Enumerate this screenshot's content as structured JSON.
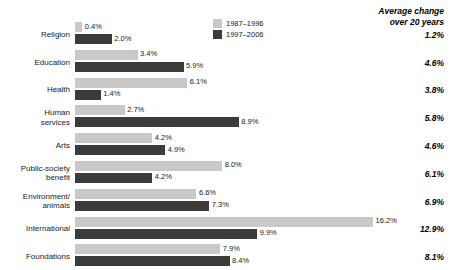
{
  "legend": {
    "position": "top-center-right",
    "items": [
      {
        "label": "1987–1996",
        "color": "#c9c9c9"
      },
      {
        "label": "1997–2006",
        "color": "#3b3b3b"
      }
    ]
  },
  "avg_header": {
    "line1": "Average change",
    "line2": "over 20 years"
  },
  "chart_data": {
    "type": "bar",
    "orientation": "horizontal",
    "title": "",
    "subtitle": "",
    "xlabel": "",
    "ylabel": "",
    "xlim": [
      0,
      16.2
    ],
    "grid": false,
    "legend_position": "top-right",
    "value_suffix": "%",
    "categories": [
      "Religion",
      "Education",
      "Health",
      "Human\nservices",
      "Arts",
      "Public-society\nbenefit",
      "Environment/\nanimals",
      "International",
      "Foundations"
    ],
    "series": [
      {
        "name": "1987–1996",
        "color": "#c9c9c9",
        "values": [
          0.4,
          3.4,
          6.1,
          2.7,
          4.2,
          8.0,
          6.6,
          16.2,
          7.9
        ],
        "labels": [
          "0.4%",
          "3.4%",
          "6.1%",
          "2.7%",
          "4.2%",
          "8.0%",
          "6.6%",
          "16.2%",
          "7.9%"
        ]
      },
      {
        "name": "1997–2006",
        "color": "#3b3b3b",
        "values": [
          2.0,
          5.9,
          1.4,
          8.9,
          4.9,
          4.2,
          7.3,
          9.9,
          8.4
        ],
        "labels": [
          "2.0%",
          "5.9%",
          "1.4%",
          "8.9%",
          "4.9%",
          "4.2%",
          "7.3%",
          "9.9%",
          "8.4%"
        ]
      }
    ],
    "annotations": {
      "name": "Average change over 20 years",
      "values": [
        1.2,
        4.6,
        3.8,
        5.8,
        4.6,
        6.1,
        6.9,
        12.9,
        8.1
      ],
      "labels": [
        "1.2%",
        "4.6%",
        "3.8%",
        "5.8%",
        "4.6%",
        "6.1%",
        "6.9%",
        "12.9%",
        "8.1%"
      ]
    }
  },
  "colors": {
    "series_light": "#c9c9c9",
    "series_dark": "#3b3b3b",
    "text": "#1a1a1a",
    "background": "#ffffff"
  }
}
